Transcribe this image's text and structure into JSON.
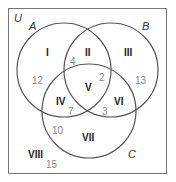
{
  "diagram": {
    "type": "venn-3-set",
    "universe_label": "U",
    "sets": [
      {
        "name": "A",
        "label": "A"
      },
      {
        "name": "B",
        "label": "B"
      },
      {
        "name": "C",
        "label": "C"
      }
    ],
    "regions": [
      {
        "id": "I",
        "label": "I",
        "count": "12"
      },
      {
        "id": "II",
        "label": "II",
        "count": "4"
      },
      {
        "id": "III",
        "label": "III",
        "count": "13"
      },
      {
        "id": "IV",
        "label": "IV",
        "count": "7"
      },
      {
        "id": "V",
        "label": "V",
        "count": "2"
      },
      {
        "id": "VI",
        "label": "VI",
        "count": "3"
      },
      {
        "id": "VII",
        "label": "VII",
        "count": "10"
      },
      {
        "id": "VIII",
        "label": "VIII",
        "count": "15"
      }
    ],
    "colors": {
      "outline": "#555555",
      "region_label": "#222222",
      "count": "#888888",
      "background": "#ffffff"
    }
  }
}
